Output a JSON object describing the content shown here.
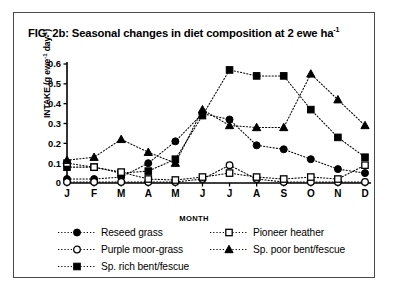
{
  "figure": {
    "title_main": "FIG. 2b: Seasonal changes in diet composition at 2 ewe ha",
    "title_sup": "-1"
  },
  "axes": {
    "ylabel_main": "INTAKE (g ewe",
    "ylabel_sup1": "-1",
    "ylabel_mid": " day",
    "ylabel_sup2": "-1",
    "ylabel_end": ")",
    "xlabel": "MONTH"
  },
  "legend": {
    "items": [
      {
        "label": "Reseed grass",
        "marker": "filled-circle",
        "name": "legend-reseed-grass"
      },
      {
        "label": "Pioneer heather",
        "marker": "open-square",
        "name": "legend-pioneer-heather"
      },
      {
        "label": "Purple moor-grass",
        "marker": "open-circle",
        "name": "legend-purple-moor-grass"
      },
      {
        "label": "Sp. poor bent/fescue",
        "marker": "filled-triangle",
        "name": "legend-sp-poor-bent-fescue"
      },
      {
        "label": "Sp. rich bent/fescue",
        "marker": "filled-square",
        "name": "legend-sp-rich-bent-fescue"
      }
    ]
  },
  "chart_data": {
    "type": "line",
    "title": "FIG. 2b: Seasonal changes in diet composition at 2 ewe ha-1",
    "xlabel": "MONTH",
    "ylabel": "INTAKE (g ewe-1 day-1)",
    "categories": [
      "J",
      "F",
      "M",
      "A",
      "M",
      "J",
      "J",
      "A",
      "S",
      "O",
      "N",
      "D"
    ],
    "category_names": [
      "January",
      "February",
      "March",
      "April",
      "May",
      "June",
      "July",
      "August",
      "September",
      "October",
      "November",
      "December"
    ],
    "ylim": [
      0,
      0.6
    ],
    "yticks": [
      0,
      0.1,
      0.2,
      0.3,
      0.4,
      0.5,
      0.6
    ],
    "ytick_labels": [
      "0",
      "0.1",
      "0.2",
      "0.3",
      "0.4",
      "0.5",
      "0.6"
    ],
    "grid": false,
    "legend_position": "below",
    "line_style": "dotted",
    "series": [
      {
        "name": "Reseed grass",
        "marker": "filled-circle",
        "color": "#000000",
        "values": [
          0.02,
          0.02,
          0.03,
          0.1,
          0.21,
          0.35,
          0.32,
          0.19,
          0.17,
          0.12,
          0.07,
          0.05
        ]
      },
      {
        "name": "Purple moor-grass",
        "marker": "open-circle",
        "color": "#000000",
        "values": [
          0.005,
          0.005,
          0.005,
          0.005,
          0.005,
          0.02,
          0.09,
          0.02,
          0.005,
          0.005,
          0.005,
          0.005
        ]
      },
      {
        "name": "Sp. rich bent/fescue",
        "marker": "filled-square",
        "color": "#000000",
        "values": [
          0.08,
          0.08,
          0.05,
          0.06,
          0.12,
          0.34,
          0.57,
          0.54,
          0.54,
          0.37,
          0.23,
          0.13
        ]
      },
      {
        "name": "Pioneer heather",
        "marker": "open-square",
        "color": "#000000",
        "values": [
          0.1,
          0.08,
          0.055,
          0.02,
          0.015,
          0.03,
          0.05,
          0.03,
          0.02,
          0.03,
          0.02,
          0.09
        ]
      },
      {
        "name": "Sp. poor bent/fescue",
        "marker": "filled-triangle",
        "color": "#000000",
        "values": [
          0.115,
          0.13,
          0.22,
          0.155,
          0.1,
          0.37,
          0.29,
          0.28,
          0.28,
          0.55,
          0.42,
          0.29
        ]
      }
    ]
  }
}
